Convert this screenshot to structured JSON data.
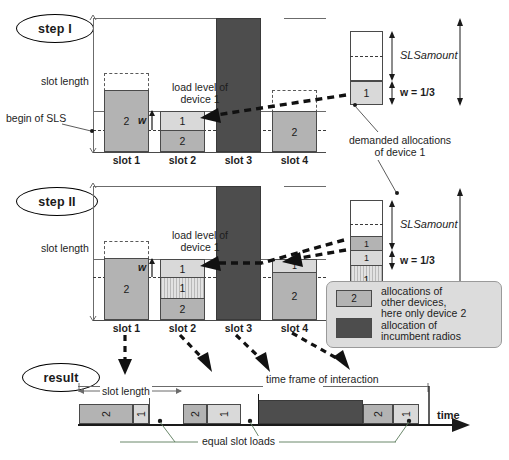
{
  "figure": {
    "steps": [
      {
        "badge": "step I",
        "labels": {
          "slot_length": "slot length",
          "begin_of_sls": "begin of SLS",
          "load_level": "load level of\ndevice 1",
          "load_level_l1": "load level of",
          "load_level_l2": "device 1",
          "w_symbol": "w",
          "demanded_l1": "demanded allocations",
          "demanded_l2": "of device 1",
          "sls_amount": "SLSamount",
          "w_value": "w = 1/3"
        },
        "slots": [
          {
            "name": "slot 1",
            "segments": [
              {
                "label": "2",
                "kind": "other"
              }
            ]
          },
          {
            "name": "slot 2",
            "segments": [
              {
                "label": "1",
                "kind": "device1"
              },
              {
                "label": "2",
                "kind": "other"
              }
            ]
          },
          {
            "name": "slot 3",
            "segments": [
              {
                "label": "",
                "kind": "incumbent"
              }
            ]
          },
          {
            "name": "slot 4",
            "segments": [
              {
                "label": "2",
                "kind": "other"
              }
            ]
          }
        ],
        "demand_column": {
          "segments": [
            {
              "label": "",
              "kind": "empty"
            },
            {
              "label": "1",
              "kind": "device1"
            }
          ]
        }
      },
      {
        "badge": "step II",
        "labels": {
          "slot_length": "slot length",
          "load_level_l1": "load level of",
          "load_level_l2": "device 1",
          "w_symbol": "w",
          "sls_amount": "SLSamount",
          "w_value": "w = 1/3"
        },
        "slots": [
          {
            "name": "slot 1",
            "segments": [
              {
                "label": "2",
                "kind": "other"
              }
            ]
          },
          {
            "name": "slot 2",
            "segments": [
              {
                "label": "1",
                "kind": "device1"
              },
              {
                "label": "1",
                "kind": "granted"
              },
              {
                "label": "2",
                "kind": "other"
              }
            ]
          },
          {
            "name": "slot 3",
            "segments": [
              {
                "label": "",
                "kind": "incumbent"
              }
            ]
          },
          {
            "name": "slot 4",
            "segments": [
              {
                "label": "1",
                "kind": "device1"
              },
              {
                "label": "2",
                "kind": "other"
              }
            ]
          }
        ],
        "demand_column": {
          "segments": [
            {
              "label": "",
              "kind": "empty"
            },
            {
              "label": "1",
              "kind": "other"
            },
            {
              "label": "1",
              "kind": "device1"
            },
            {
              "label": "1",
              "kind": "granted"
            }
          ]
        }
      }
    ],
    "result": {
      "badge": "result",
      "labels": {
        "slot_length": "slot length",
        "time_frame": "time frame of interaction",
        "equal_slot_loads": "equal slot loads",
        "time_axis": "time"
      },
      "segments": [
        {
          "label": "2",
          "kind": "other"
        },
        {
          "label": "1",
          "kind": "device1"
        },
        {
          "label": "",
          "kind": "gap"
        },
        {
          "label": "2",
          "kind": "other"
        },
        {
          "label": "1",
          "kind": "device1"
        },
        {
          "label": "",
          "kind": "gap"
        },
        {
          "label": "",
          "kind": "incumbent"
        },
        {
          "label": "2",
          "kind": "other"
        },
        {
          "label": "1",
          "kind": "device1"
        }
      ]
    },
    "legend": {
      "items": [
        {
          "swatch": "2",
          "kind": "other",
          "line1": "allocations of",
          "line2": "other devices,",
          "line3": "here only device 2"
        },
        {
          "swatch": "",
          "kind": "incumbent",
          "line1": "allocation of",
          "line2": "incumbent radios",
          "line3": ""
        }
      ]
    },
    "colors": {
      "other_devices": "#b3b3b3",
      "device1": "#d9d9d9",
      "incumbent": "#4d4d4d",
      "granted_hatch": "#cfcfcf",
      "outline": "#4a4a4a",
      "legend_bg": "#dcdcdc"
    }
  }
}
